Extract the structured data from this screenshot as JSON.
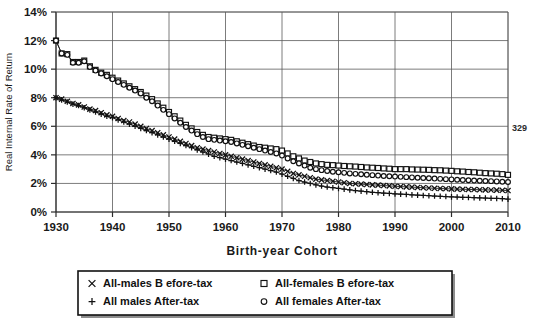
{
  "page": {
    "number": "329"
  },
  "chart_data": {
    "type": "line",
    "title": "",
    "xlabel": "Birth-year Cohort",
    "ylabel": "Real Internal Rate of Return",
    "xlim": [
      1930,
      2010
    ],
    "ylim": [
      0,
      14
    ],
    "xticks": [
      "1930",
      "1940",
      "1950",
      "1960",
      "1970",
      "1980",
      "1990",
      "2000",
      "2010"
    ],
    "yticks": [
      "0%",
      "2%",
      "4%",
      "6%",
      "8%",
      "10%",
      "12%",
      "14%"
    ],
    "grid": true,
    "legend_position": "below",
    "x": [
      1930,
      1931,
      1932,
      1933,
      1934,
      1935,
      1936,
      1937,
      1938,
      1939,
      1940,
      1941,
      1942,
      1943,
      1944,
      1945,
      1946,
      1947,
      1948,
      1949,
      1950,
      1951,
      1952,
      1953,
      1954,
      1955,
      1956,
      1957,
      1958,
      1959,
      1960,
      1961,
      1962,
      1963,
      1964,
      1965,
      1966,
      1967,
      1968,
      1969,
      1970,
      1971,
      1972,
      1973,
      1974,
      1975,
      1976,
      1977,
      1978,
      1979,
      1980,
      1981,
      1982,
      1983,
      1984,
      1985,
      1986,
      1987,
      1988,
      1989,
      1990,
      1991,
      1992,
      1993,
      1994,
      1995,
      1996,
      1997,
      1998,
      1999,
      2000,
      2001,
      2002,
      2003,
      2004,
      2005,
      2006,
      2007,
      2008,
      2009,
      2010
    ],
    "series": [
      {
        "name": "All-males Before-tax",
        "marker": "x",
        "values": [
          8.0,
          7.9,
          7.75,
          7.6,
          7.5,
          7.35,
          7.2,
          7.1,
          6.95,
          6.8,
          6.7,
          6.55,
          6.4,
          6.3,
          6.15,
          6.0,
          5.85,
          5.7,
          5.55,
          5.4,
          5.25,
          5.1,
          4.95,
          4.8,
          4.65,
          4.5,
          4.4,
          4.3,
          4.2,
          4.1,
          4.0,
          3.9,
          3.8,
          3.7,
          3.6,
          3.5,
          3.4,
          3.3,
          3.2,
          3.1,
          3.0,
          2.85,
          2.7,
          2.6,
          2.5,
          2.4,
          2.3,
          2.25,
          2.2,
          2.15,
          2.1,
          2.05,
          2.0,
          1.98,
          1.95,
          1.92,
          1.9,
          1.88,
          1.85,
          1.83,
          1.8,
          1.78,
          1.76,
          1.74,
          1.72,
          1.7,
          1.68,
          1.66,
          1.65,
          1.63,
          1.62,
          1.6,
          1.59,
          1.58,
          1.57,
          1.56,
          1.55,
          1.54,
          1.53,
          1.52,
          1.5
        ]
      },
      {
        "name": "All males After-tax",
        "marker": "+",
        "values": [
          8.0,
          7.85,
          7.7,
          7.55,
          7.45,
          7.3,
          7.15,
          7.0,
          6.85,
          6.7,
          6.6,
          6.45,
          6.3,
          6.15,
          6.0,
          5.85,
          5.7,
          5.55,
          5.4,
          5.25,
          5.1,
          4.95,
          4.8,
          4.65,
          4.5,
          4.35,
          4.2,
          4.05,
          3.9,
          3.8,
          3.7,
          3.6,
          3.5,
          3.4,
          3.3,
          3.2,
          3.1,
          3.0,
          2.9,
          2.8,
          2.65,
          2.5,
          2.35,
          2.2,
          2.1,
          2.0,
          1.9,
          1.82,
          1.75,
          1.7,
          1.65,
          1.6,
          1.55,
          1.5,
          1.46,
          1.42,
          1.38,
          1.35,
          1.32,
          1.3,
          1.27,
          1.25,
          1.23,
          1.2,
          1.18,
          1.16,
          1.14,
          1.12,
          1.1,
          1.08,
          1.06,
          1.05,
          1.03,
          1.02,
          1.0,
          0.99,
          0.98,
          0.96,
          0.95,
          0.93,
          0.9
        ]
      },
      {
        "name": "All-females Before-tax",
        "marker": "square",
        "values": [
          12.0,
          11.1,
          11.05,
          10.5,
          10.5,
          10.6,
          10.2,
          9.95,
          9.75,
          9.6,
          9.4,
          9.2,
          9.0,
          8.8,
          8.6,
          8.4,
          8.15,
          7.9,
          7.6,
          7.3,
          7.0,
          6.7,
          6.4,
          6.1,
          5.85,
          5.6,
          5.4,
          5.25,
          5.2,
          5.15,
          5.1,
          5.05,
          4.95,
          4.85,
          4.75,
          4.65,
          4.55,
          4.5,
          4.45,
          4.4,
          4.3,
          4.1,
          3.9,
          3.75,
          3.6,
          3.5,
          3.4,
          3.35,
          3.3,
          3.28,
          3.25,
          3.22,
          3.2,
          3.18,
          3.15,
          3.12,
          3.1,
          3.08,
          3.05,
          3.03,
          3.0,
          3.0,
          3.0,
          2.98,
          2.97,
          2.96,
          2.95,
          2.93,
          2.92,
          2.9,
          2.88,
          2.85,
          2.83,
          2.8,
          2.78,
          2.75,
          2.72,
          2.7,
          2.68,
          2.65,
          2.6
        ]
      },
      {
        "name": "All females After-tax",
        "marker": "circle",
        "values": [
          12.0,
          11.1,
          11.0,
          10.45,
          10.45,
          10.55,
          10.15,
          9.9,
          9.7,
          9.5,
          9.3,
          9.1,
          8.9,
          8.7,
          8.5,
          8.3,
          8.0,
          7.75,
          7.45,
          7.15,
          6.85,
          6.55,
          6.25,
          5.95,
          5.7,
          5.45,
          5.25,
          5.1,
          5.05,
          5.0,
          4.95,
          4.9,
          4.8,
          4.7,
          4.6,
          4.5,
          4.4,
          4.3,
          4.2,
          4.1,
          3.95,
          3.75,
          3.55,
          3.4,
          3.25,
          3.1,
          3.0,
          2.93,
          2.87,
          2.82,
          2.78,
          2.74,
          2.7,
          2.67,
          2.64,
          2.61,
          2.58,
          2.55,
          2.52,
          2.5,
          2.48,
          2.46,
          2.44,
          2.42,
          2.4,
          2.38,
          2.36,
          2.34,
          2.32,
          2.3,
          2.28,
          2.26,
          2.24,
          2.22,
          2.2,
          2.19,
          2.17,
          2.16,
          2.14,
          2.12,
          2.1
        ]
      }
    ]
  },
  "legend": {
    "entries": [
      {
        "label": "All-males  B efore-tax",
        "marker": "x"
      },
      {
        "label": "All-females  B efore-tax",
        "marker": "square"
      },
      {
        "label": "All males  After-tax",
        "marker": "+"
      },
      {
        "label": "All females  After-tax",
        "marker": "circle"
      }
    ]
  }
}
